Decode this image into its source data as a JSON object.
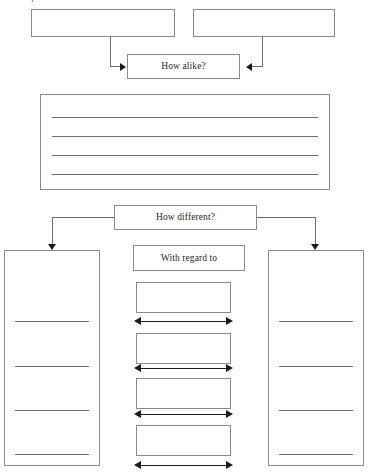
{
  "page": {
    "clipped_heading": "noted topics",
    "width": 368,
    "height": 475,
    "background": "#ffffff",
    "line_color": "#6f6f6f",
    "border_color": "#8a8a8a",
    "arrow_color": "#1a1a1a"
  },
  "compare": {
    "subject_a": {
      "label": ""
    },
    "subject_b": {
      "label": ""
    },
    "prompt": {
      "label": "How alike?"
    },
    "answer_lines": [
      "",
      "",
      "",
      ""
    ]
  },
  "contrast": {
    "prompt": {
      "label": "How different?"
    },
    "aspect_header": {
      "label": "With regard to"
    },
    "aspects": [
      {
        "label": ""
      },
      {
        "label": ""
      },
      {
        "label": ""
      },
      {
        "label": ""
      }
    ],
    "left_column": {
      "lines": [
        "",
        "",
        "",
        ""
      ]
    },
    "right_column": {
      "lines": [
        "",
        "",
        "",
        ""
      ]
    }
  }
}
